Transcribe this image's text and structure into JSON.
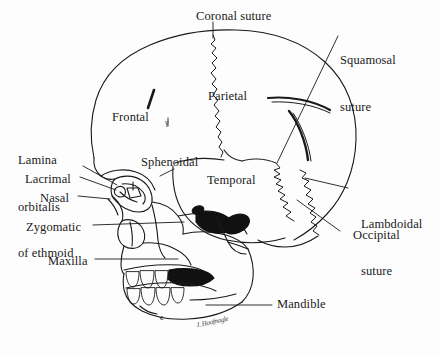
{
  "figure": {
    "background_color": "#fdfdfd",
    "ink_color": "#1a1a1a"
  },
  "labels": {
    "coronal_suture": "Coronal suture",
    "squamosal_suture_line1": "Squamosal",
    "squamosal_suture_line2": "suture",
    "parietal": "Parietal",
    "frontal": "Frontal",
    "lamina_line1": "Lamina",
    "lamina_line2": "orbitalis",
    "lamina_line3": "of ethmoid",
    "sphenoidal": "Sphenoidal",
    "lacrimal": "Lacrimal",
    "nasal": "Nasal",
    "temporal": "Temporal",
    "zygomatic": "Zygomatic",
    "maxilla": "Maxilla",
    "lambdoidal_line1": "Lambdoidal",
    "lambdoidal_line2": "suture",
    "occipital": "Occipital",
    "mandible": "Mandible",
    "chin_mark": "c",
    "artist_signature": "J. Hoofnagle"
  },
  "anatomy": {
    "bones": [
      "Frontal",
      "Parietal",
      "Temporal",
      "Occipital",
      "Sphenoidal",
      "Nasal",
      "Lacrimal",
      "Zygomatic",
      "Maxilla",
      "Mandible",
      "Lamina orbitalis of ethmoid"
    ],
    "sutures": [
      "Coronal suture",
      "Squamosal suture",
      "Lambdoidal suture"
    ]
  }
}
